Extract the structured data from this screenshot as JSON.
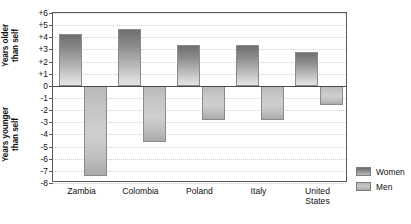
{
  "chart_data": {
    "type": "bar",
    "title": "",
    "subtitle": "",
    "xlabel": "",
    "ylabel_upper_line1": "Years older",
    "ylabel_upper_line2": "than self",
    "ylabel_lower_line1": "Years younger",
    "ylabel_lower_line2": "than self",
    "categories": [
      "Zambia",
      "Colombia",
      "Poland",
      "Italy",
      "United States"
    ],
    "category_lines": [
      [
        "Zambia"
      ],
      [
        "Colombia"
      ],
      [
        "Poland"
      ],
      [
        "Italy"
      ],
      [
        "United",
        "States"
      ]
    ],
    "series": [
      {
        "name": "Women",
        "values": [
          4.3,
          4.7,
          3.4,
          3.4,
          2.8
        ],
        "color": "#8a8a8a"
      },
      {
        "name": "Men",
        "values": [
          -7.4,
          -4.6,
          -2.8,
          -2.8,
          -1.6
        ],
        "color": "#c4c4c4"
      }
    ],
    "ylim": [
      -8,
      6
    ],
    "ytick_values": [
      6,
      5,
      4,
      3,
      2,
      1,
      0,
      -1,
      -2,
      -3,
      -4,
      -5,
      -6,
      -7,
      -8
    ],
    "ytick_labels": [
      "+6",
      "+5",
      "+4",
      "+3",
      "+2",
      "+1",
      "0",
      "-1",
      "-2",
      "-3",
      "-4",
      "-5",
      "-6",
      "-7",
      "-8"
    ],
    "zero_reference": 0,
    "grid": true,
    "grid_style": "dotted-horizontal",
    "legend_position": "outside-bottom-right",
    "orientation": "vertical",
    "bar_fill_style": "vertical-gradient",
    "axis_color": "#5a5a5a",
    "grid_color": "#cfcfcf",
    "background": "#ffffff"
  },
  "legend": {
    "items": [
      {
        "label": "Women"
      },
      {
        "label": "Men"
      }
    ]
  }
}
